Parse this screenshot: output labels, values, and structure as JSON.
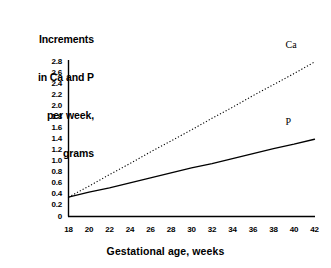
{
  "chart_data": {
    "type": "line",
    "title": "",
    "ylabel": "Increments in Ca and P per week, grams",
    "ylabel_lines": [
      "Increments",
      "in Ca and P",
      "per week,",
      "grams"
    ],
    "xlabel": "Gestational age, weeks",
    "xlim": [
      18,
      42
    ],
    "ylim": [
      0,
      2.8
    ],
    "grid": false,
    "legend_position": "inline-right",
    "xticks": [
      18,
      20,
      22,
      24,
      26,
      28,
      30,
      32,
      34,
      36,
      38,
      40,
      42
    ],
    "xtick_labels": [
      "18",
      "20",
      "22",
      "24",
      "26",
      "28",
      "30",
      "32",
      "34",
      "36",
      "38",
      "40",
      "42"
    ],
    "yticks": [
      0,
      0.2,
      0.4,
      0.6,
      0.8,
      1.0,
      1.2,
      1.4,
      1.6,
      1.8,
      2.0,
      2.2,
      2.4,
      2.6,
      2.8
    ],
    "ytick_labels": [
      "0",
      "0.2",
      "0.4",
      "0.6",
      "0.8",
      "1.0",
      "1.2",
      "1.4",
      "1.6",
      "1.8",
      "2.0",
      "2.2",
      "2.4",
      "2.6",
      "2.8"
    ],
    "x": [
      18,
      20,
      22,
      24,
      26,
      28,
      30,
      32,
      34,
      36,
      38,
      40,
      42
    ],
    "series": [
      {
        "name": "Ca",
        "label": "Ca",
        "style": "dotted",
        "color": "#000000",
        "values": [
          0.35,
          0.55,
          0.76,
          0.96,
          1.17,
          1.37,
          1.57,
          1.78,
          1.98,
          2.19,
          2.39,
          2.59,
          2.8
        ]
      },
      {
        "name": "P",
        "label": "P",
        "style": "solid",
        "color": "#000000",
        "values": [
          0.35,
          0.44,
          0.52,
          0.61,
          0.7,
          0.79,
          0.88,
          0.96,
          1.05,
          1.14,
          1.23,
          1.31,
          1.4
        ]
      }
    ]
  },
  "axis": {
    "line_color": "#000000"
  }
}
